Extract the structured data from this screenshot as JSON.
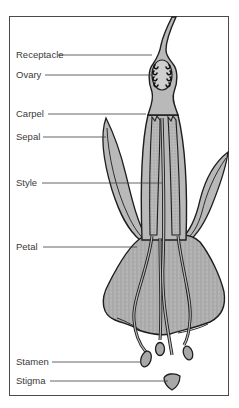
{
  "diagram": {
    "colors": {
      "fill": "#b9b9b9",
      "outline": "#1e1e1e",
      "leader": "#3c3c3c",
      "label": "#3a3a3a",
      "frame": "#4a4a4a"
    },
    "labels": [
      {
        "id": "receptacle",
        "text": "Receptacle",
        "x": 16,
        "y": 50,
        "line_x1": 58,
        "line_x2": 152,
        "line_y": 55
      },
      {
        "id": "ovary",
        "text": "Ovary",
        "x": 16,
        "y": 70,
        "line_x1": 45,
        "line_x2": 146,
        "line_y": 75
      },
      {
        "id": "carpel",
        "text": "Carpel",
        "x": 16,
        "y": 109,
        "line_x1": 48,
        "line_x2": 146,
        "line_y": 114
      },
      {
        "id": "sepal",
        "text": "Sepal",
        "x": 16,
        "y": 132,
        "line_x1": 43,
        "line_x2": 106,
        "line_y": 137
      },
      {
        "id": "style",
        "text": "Style",
        "x": 16,
        "y": 178,
        "line_x1": 42,
        "line_x2": 162,
        "line_y": 183
      },
      {
        "id": "petal",
        "text": "Petal",
        "x": 16,
        "y": 242,
        "line_x1": 43,
        "line_x2": 137,
        "line_y": 247
      },
      {
        "id": "stamen",
        "text": "Stamen",
        "x": 16,
        "y": 357,
        "line_x1": 52,
        "line_x2": 141,
        "line_y": 362
      },
      {
        "id": "stigma",
        "text": "Stigma",
        "x": 16,
        "y": 376,
        "line_x1": 50,
        "line_x2": 170,
        "line_y": 381
      }
    ]
  }
}
